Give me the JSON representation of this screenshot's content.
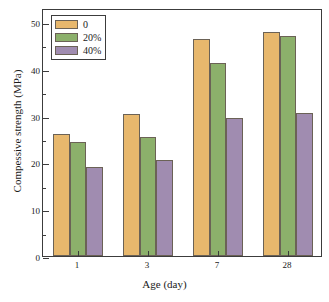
{
  "chart_data": {
    "type": "bar",
    "title": "",
    "xlabel": "Age (day)",
    "ylabel": "Compessive strength (MPa)",
    "categories": [
      "1",
      "3",
      "7",
      "28"
    ],
    "series": [
      {
        "name": "0",
        "color": "#e8b86d",
        "values": [
          26.1,
          30.4,
          46.4,
          47.9
        ]
      },
      {
        "name": "20%",
        "color": "#8cb06b",
        "values": [
          24.3,
          25.5,
          41.3,
          47.1
        ]
      },
      {
        "name": "40%",
        "color": "#a08cb0",
        "values": [
          19.0,
          20.5,
          29.5,
          30.5
        ]
      }
    ],
    "ylim": [
      0,
      53
    ],
    "yticks": [
      0,
      10,
      20,
      30,
      40,
      50
    ],
    "ytick_labels": [
      "0",
      "10",
      "20",
      "30",
      "40",
      "50"
    ],
    "yminor_ticks": [
      5,
      15,
      25,
      35,
      45
    ],
    "grid": false,
    "legend_position": "top-left"
  }
}
